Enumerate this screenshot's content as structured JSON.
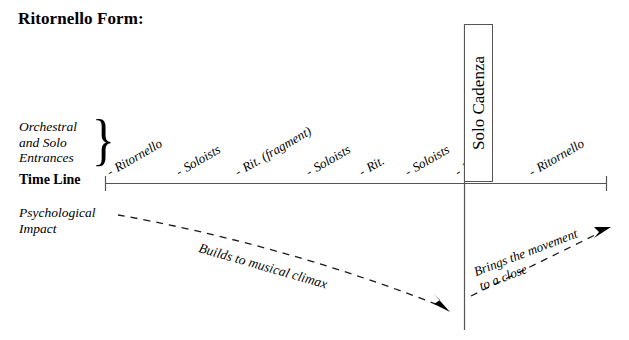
{
  "title": "Ritornello Form:",
  "axes": {
    "entrances_label_lines": [
      "Orchestral",
      "and Solo",
      "Entrances"
    ],
    "brace_glyph": "}",
    "timeline_label": "Time Line",
    "impact_label_lines": [
      "Psychological",
      "Impact"
    ]
  },
  "entrances": [
    {
      "label": "Ritornello",
      "x": 112,
      "y": 178
    },
    {
      "label": "Soloists",
      "x": 181,
      "y": 178
    },
    {
      "label": "Rit. (fragment)",
      "x": 240,
      "y": 178
    },
    {
      "label": "Soloists",
      "x": 311,
      "y": 178
    },
    {
      "label": "Rit.",
      "x": 364,
      "y": 178
    },
    {
      "label": "Soloists",
      "x": 410,
      "y": 178
    },
    {
      "label": "Rit.",
      "x": 460,
      "y": 178
    },
    {
      "label": "Ritornello",
      "x": 534,
      "y": 178
    }
  ],
  "lead_dash": "-",
  "solo_cadenza": {
    "label": "Solo Cadenza"
  },
  "psychological": {
    "first_arrow_caption": "Builds to musical climax",
    "second_arrow_caption_lines": [
      "Brings the movement",
      "to a close"
    ]
  },
  "colors": {
    "ink": "#000000",
    "rule": "#555555",
    "background": "#ffffff"
  },
  "timeline": {
    "y": 183,
    "x_start": 105,
    "x_end": 607
  }
}
